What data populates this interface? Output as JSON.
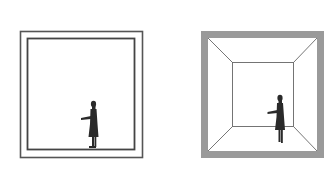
{
  "diagram": {
    "panels": [
      {
        "id": "flat-room",
        "style": "double-line frame",
        "figure": "person-silhouette"
      },
      {
        "id": "perspective-room",
        "style": "gray frame with one-point perspective walls",
        "figure": "person-silhouette"
      }
    ],
    "colors": {
      "line": "#555555",
      "frame_gray": "#9a9a9a",
      "figure": "#2a2a2a",
      "background": "#ffffff"
    }
  }
}
